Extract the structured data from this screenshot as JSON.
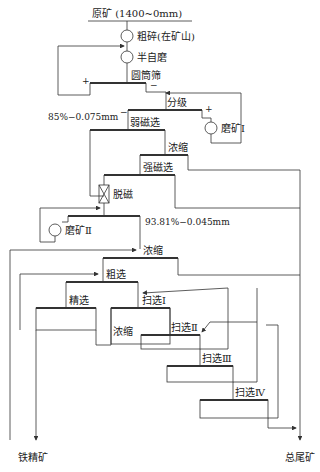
{
  "diagram": {
    "type": "mineral-processing-flowsheet",
    "feed": "原矿 (1400~0mm)",
    "nodes": {
      "coarse_crush": "粗碎(在矿山)",
      "sag_mill": "半自磨",
      "trommel": "圆筒筛",
      "classify": "分级",
      "mill1": "磨矿Ⅰ",
      "grind1_spec": "85%−0.075mm",
      "lims": "弱磁选",
      "thicken1": "浓缩",
      "hims": "强磁选",
      "demag": "脱磁",
      "grind2_spec": "93.81%−0.045mm",
      "mill2": "磨矿Ⅱ",
      "thicken2": "浓缩",
      "rougher": "粗选",
      "cleaner": "精选",
      "scav1": "扫选Ⅰ",
      "thicken3": "浓缩",
      "scav2": "扫选Ⅱ",
      "scav3": "扫选Ⅲ",
      "scav4": "扫选Ⅳ"
    },
    "signs": {
      "plus": "+",
      "minus": "−"
    },
    "products": {
      "concentrate": "铁精矿",
      "tailings": "总尾矿"
    }
  }
}
